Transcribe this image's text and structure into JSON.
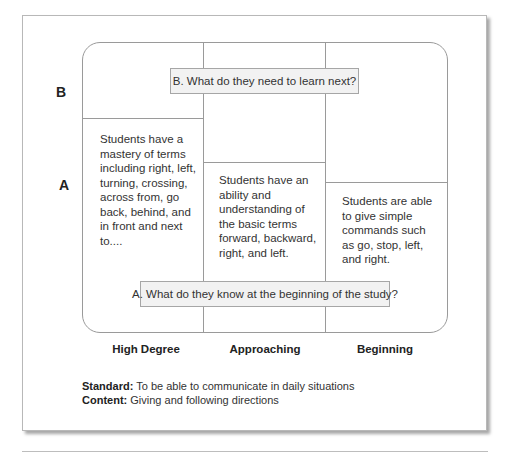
{
  "diagram": {
    "row_labels": {
      "b": "B",
      "a": "A"
    },
    "questions": {
      "b": "B. What do they need to learn next?",
      "a": "A. What do they know at the beginning of the study?"
    },
    "columns": [
      {
        "label": "High Degree",
        "text": "Students have a mastery of terms including right, left, turning, crossing, across from, go back, behind, and in front and next to...."
      },
      {
        "label": "Approaching",
        "text": "Students have an ability and understanding of the basic terms forward, backward, right, and left."
      },
      {
        "label": "Beginning",
        "text": "Students are able to give simple commands such as go, stop, left, and right."
      }
    ],
    "footer": {
      "standard_label": "Standard:",
      "standard_text": " To be able to communicate in daily situations",
      "content_label": "Content:",
      "content_text": " Giving and following directions"
    }
  }
}
